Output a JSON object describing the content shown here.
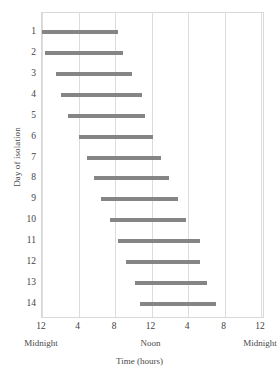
{
  "chart_data": {
    "type": "bar",
    "orientation": "horizontal",
    "title": "",
    "xlabel": "Time (hours)",
    "ylabel": "Day of isolation",
    "xlim": [
      0,
      24.5
    ],
    "ylim": [
      0.5,
      14.5
    ],
    "grid": true,
    "legend": null,
    "bar_color": "#858585",
    "frame_color": "#d8d8d8",
    "x_ticks": [
      {
        "value": 0,
        "label": "12"
      },
      {
        "value": 4,
        "label": "4"
      },
      {
        "value": 8,
        "label": "8"
      },
      {
        "value": 12,
        "label": "12"
      },
      {
        "value": 16,
        "label": "4"
      },
      {
        "value": 20,
        "label": "8"
      },
      {
        "value": 24,
        "label": "12"
      }
    ],
    "x_period_labels": [
      {
        "value": 0,
        "label": "Midnight"
      },
      {
        "value": 12,
        "label": "Noon"
      },
      {
        "value": 24,
        "label": "Midnight"
      }
    ],
    "y_ticks": [
      "1",
      "2",
      "3",
      "4",
      "5",
      "6",
      "7",
      "8",
      "9",
      "10",
      "11",
      "12",
      "13",
      "14"
    ],
    "categories": [
      1,
      2,
      3,
      4,
      5,
      6,
      7,
      8,
      9,
      10,
      11,
      12,
      13,
      14
    ],
    "bars": [
      {
        "day": 1,
        "start": 0.0,
        "end": 8.3
      },
      {
        "day": 2,
        "start": 0.3,
        "end": 8.9
      },
      {
        "day": 3,
        "start": 1.5,
        "end": 9.9
      },
      {
        "day": 4,
        "start": 2.1,
        "end": 10.9
      },
      {
        "day": 5,
        "start": 2.9,
        "end": 11.3
      },
      {
        "day": 6,
        "start": 4.1,
        "end": 12.2
      },
      {
        "day": 7,
        "start": 4.9,
        "end": 13.0
      },
      {
        "day": 8,
        "start": 5.7,
        "end": 13.9
      },
      {
        "day": 9,
        "start": 6.5,
        "end": 14.9
      },
      {
        "day": 10,
        "start": 7.4,
        "end": 15.8
      },
      {
        "day": 11,
        "start": 8.3,
        "end": 17.3
      },
      {
        "day": 12,
        "start": 9.2,
        "end": 17.3
      },
      {
        "day": 13,
        "start": 10.2,
        "end": 18.1
      },
      {
        "day": 14,
        "start": 10.7,
        "end": 19.1
      }
    ]
  }
}
